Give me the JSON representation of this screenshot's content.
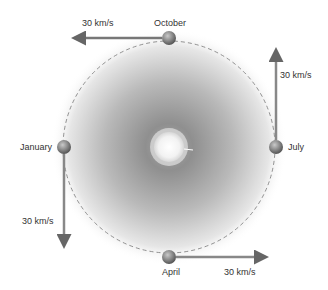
{
  "diagram": {
    "title": "",
    "orbit": {
      "cx": 169,
      "cy": 147,
      "r": 106,
      "style": "dashed"
    },
    "sun": {
      "cx": 169,
      "cy": 147,
      "r": 15
    },
    "positions": [
      {
        "month": "October",
        "speed": "30 km/s",
        "direction": "left"
      },
      {
        "month": "July",
        "speed": "30 km/s",
        "direction": "up"
      },
      {
        "month": "January",
        "speed": "30 km/s",
        "direction": "down"
      },
      {
        "month": "April",
        "speed": "30 km/s",
        "direction": "right"
      }
    ]
  }
}
